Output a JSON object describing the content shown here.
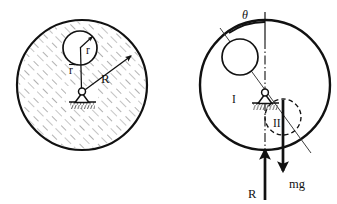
{
  "figure": {
    "type": "physics-mechanics-diagram",
    "width": 337,
    "height": 204,
    "background_color": "#ffffff",
    "ink_color": "#111111",
    "hatch_color": "#8a8a8a",
    "panels": [
      {
        "id": "left",
        "name": "geometry-panel",
        "caption": ""
      },
      {
        "id": "right",
        "name": "free-body-panel",
        "caption": ""
      }
    ]
  },
  "left_panel": {
    "big_disk": {
      "name": "large-disk",
      "cx": 82,
      "cy": 85,
      "r": 65,
      "stroke_width": 2.2,
      "hatched": true,
      "hatch_angle_deg": -45
    },
    "hole": {
      "name": "circular-hole",
      "cx": 80,
      "cy": 48,
      "r": 17,
      "stroke_width": 1.6,
      "filled_white": true
    },
    "pivot": {
      "name": "pin-support",
      "x": 82,
      "y": 93,
      "pin_radius": 3.4,
      "triangle_half_width": 7,
      "triangle_height": 10,
      "ground_width": 24,
      "ground_height": 7
    },
    "labels": {
      "hole_radius": "r",
      "offset_distance": "r",
      "offset_distance_overbar": true,
      "disk_radius": "R"
    },
    "label_positions": {
      "hole_radius": {
        "x": 86,
        "y": 53
      },
      "offset_distance": {
        "x": 73,
        "y": 72
      },
      "disk_radius": {
        "x": 104,
        "y": 80
      }
    },
    "arrows": {
      "hole_radius_arrow": {
        "x1": 80,
        "y1": 48,
        "x2": 92,
        "y2": 37
      },
      "disk_radius_arrow": {
        "x1": 82,
        "y1": 93,
        "x2": 130,
        "y2": 57
      },
      "offset_line": {
        "x1": 80,
        "y1": 48,
        "x2": 81,
        "y2": 90
      }
    }
  },
  "right_panel": {
    "big_disk": {
      "name": "large-disk",
      "cx": 265,
      "cy": 85,
      "r": 65,
      "stroke_width": 2.2,
      "hatched": false
    },
    "hole": {
      "name": "circular-hole",
      "cx": 240,
      "cy": 57,
      "r": 18,
      "stroke_width": 1.6
    },
    "negative_mass": {
      "name": "negative-mass-disk",
      "cx": 283,
      "cy": 117,
      "r": 18,
      "stroke_width": 1.4,
      "dashed": true
    },
    "pivot": {
      "name": "pin-support",
      "x": 265,
      "y": 94,
      "pin_radius": 3.2,
      "triangle_half_width": 7,
      "triangle_height": 10,
      "ground_width": 24,
      "ground_height": 7
    },
    "centerline": {
      "name": "vertical-centerline",
      "x": 265,
      "y_top": 12,
      "y_bottom": 196,
      "style": "dash-dot"
    },
    "incline_line": {
      "name": "theta-reference-line",
      "x1": 221,
      "y1": 29,
      "x2": 310,
      "y2": 152,
      "style": "thin-solid"
    },
    "angle_arc": {
      "name": "theta-angle-arc",
      "cx": 265,
      "cy": 94,
      "radius": 62,
      "from_deg": -90,
      "to_deg": -125
    },
    "force_mg": {
      "name": "weight-force-arrow",
      "label": "mg",
      "x": 283,
      "y_start": 101,
      "y_end": 172,
      "direction": "down",
      "stroke_width": 2.6,
      "label_x": 296,
      "label_y": 184
    },
    "force_R": {
      "name": "reaction-force-arrow",
      "label": "R",
      "x": 265,
      "y_start": 200,
      "y_end": 150,
      "direction": "up",
      "stroke_width": 2.6,
      "label_x": 252,
      "label_y": 195
    },
    "labels": {
      "theta": "θ",
      "region_one": "I",
      "region_two": "II",
      "weight": "mg",
      "reaction": "R"
    },
    "label_positions": {
      "theta": {
        "x": 246,
        "y": 16
      },
      "region_one": {
        "x": 235,
        "y": 100
      },
      "region_two": {
        "x": 278,
        "y": 125
      }
    }
  }
}
